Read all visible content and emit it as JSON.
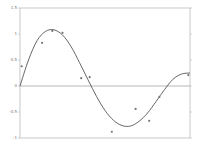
{
  "chart_data": {
    "type": "scatter",
    "title": "",
    "xlabel": "",
    "ylabel": "",
    "ylim": [
      -1,
      1.5
    ],
    "yticks": [
      1.5,
      1,
      0.5,
      0,
      -0.5,
      -1
    ],
    "ytick_labels": [
      "1.5",
      "1",
      "0.5",
      "0",
      "-0.5",
      "-1"
    ],
    "grid": false,
    "legend": null,
    "zero_line": true,
    "series": [
      {
        "name": "observations",
        "kind": "scatter",
        "x": [
          0.01,
          0.13,
          0.19,
          0.25,
          0.36,
          0.41,
          0.54,
          0.68,
          0.76,
          0.82,
          0.99
        ],
        "y": [
          0.38,
          0.83,
          1.06,
          1.02,
          0.15,
          0.17,
          -0.88,
          -0.44,
          -0.67,
          -0.21,
          0.21
        ]
      },
      {
        "name": "fitted curve",
        "kind": "line",
        "x": [
          0.0,
          0.05,
          0.1,
          0.15,
          0.2,
          0.25,
          0.3,
          0.35,
          0.4,
          0.45,
          0.5,
          0.55,
          0.6,
          0.65,
          0.7,
          0.75,
          0.8,
          0.85,
          0.9,
          0.95,
          1.0
        ],
        "y": [
          0.0,
          0.5,
          0.87,
          1.05,
          1.08,
          0.98,
          0.76,
          0.45,
          0.12,
          -0.2,
          -0.47,
          -0.66,
          -0.76,
          -0.77,
          -0.68,
          -0.52,
          -0.3,
          -0.07,
          0.13,
          0.23,
          0.25
        ]
      }
    ],
    "colors": {
      "curve": "#555555",
      "points": "#777777",
      "axes": "#bbbbbb",
      "zero_line": "#999999"
    }
  }
}
